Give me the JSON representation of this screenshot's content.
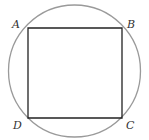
{
  "diagram": {
    "circle": {
      "cx": 74.5,
      "cy": 71,
      "r": 66,
      "stroke": "#9a9a9a"
    },
    "square": {
      "stroke": "#222222"
    },
    "vertices": [
      {
        "name": "A",
        "x": 28,
        "y": 28,
        "lx": 12,
        "ly": 28
      },
      {
        "name": "B",
        "x": 122,
        "y": 28,
        "lx": 127,
        "ly": 28
      },
      {
        "name": "C",
        "x": 122,
        "y": 118,
        "lx": 126,
        "ly": 128
      },
      {
        "name": "D",
        "x": 28,
        "y": 118,
        "lx": 13,
        "ly": 128
      }
    ]
  }
}
